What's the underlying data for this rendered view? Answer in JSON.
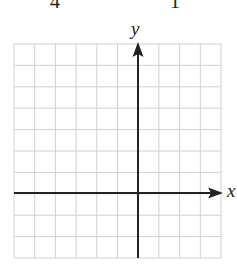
{
  "header": {
    "left_number": "4",
    "right_number": "1"
  },
  "graph": {
    "x_axis_label": "x",
    "y_axis_label": "y",
    "grid": {
      "columns": 10,
      "rows": 10,
      "cell_size_px": 20.7,
      "left": 14,
      "top": 44,
      "right": 221,
      "bottom": 258,
      "line_color": "#d0d0d0"
    },
    "origin": {
      "column": 6,
      "row": 7
    },
    "axis_color": "#222222"
  },
  "chart_data": {
    "type": "scatter",
    "title": "",
    "xlabel": "x",
    "ylabel": "y",
    "xlim": [
      -6,
      4
    ],
    "ylim": [
      -3,
      7
    ],
    "grid": true,
    "x": [],
    "y": [],
    "annotations": [
      "Blank coordinate grid with x and y axes, arrows on positive directions"
    ]
  }
}
